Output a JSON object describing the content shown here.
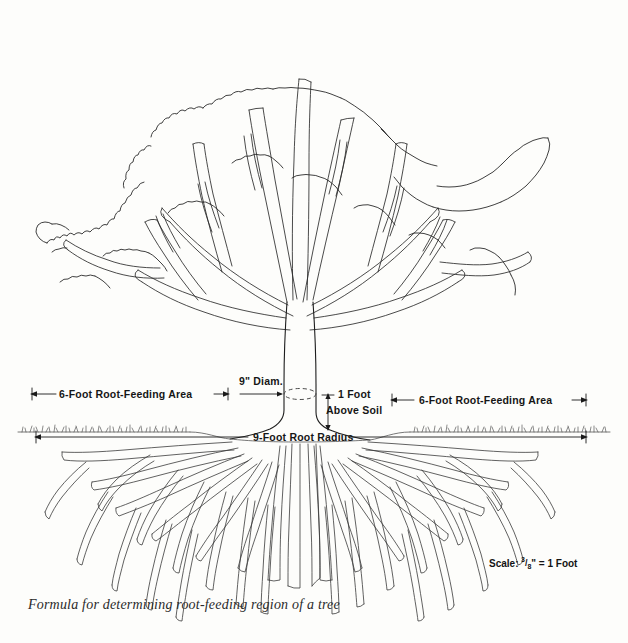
{
  "figure": {
    "caption": "Formula for determining root-feeding region of a tree",
    "scale_prefix": "Scale:",
    "scale_numerator": "3",
    "scale_denominator": "8",
    "scale_suffix": "\" = 1 Foot",
    "line_color": "#1d1d1d",
    "background": "#fdfdfb",
    "text_color": "#161616"
  },
  "labels": {
    "trunk_diameter": "9\" Diam.",
    "height_above_soil_line1": "1 Foot",
    "height_above_soil_line2": "Above Soil",
    "root_feeding_left": "6-Foot Root-Feeding Area",
    "root_feeding_right": "6-Foot Root-Feeding Area",
    "root_radius": "9-Foot Root Radius"
  },
  "measurements": {
    "trunk_diameter_inches": 9,
    "measure_height_feet": 1,
    "root_feeding_area_feet": 6,
    "root_radius_feet": 9,
    "scale_inches_per_foot": 0.375
  },
  "diagram_parts": {
    "canopy": "tree-canopy",
    "trunk": "tree-trunk",
    "soil_line": "soil-line",
    "root_system": "root-system",
    "diameter_marker": "dashed-diameter-ellipse"
  }
}
